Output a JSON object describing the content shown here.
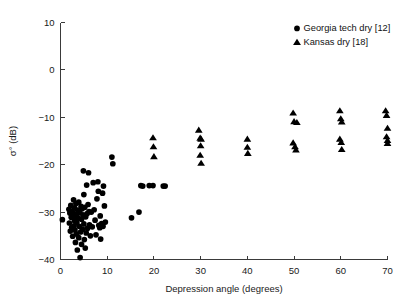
{
  "figure": {
    "background_color": "#ffffff",
    "marker_color": "#000000",
    "axis_color": "#3a3a3a"
  },
  "axes": {
    "x_title": "Depression angle (degrees)",
    "y_title": "σ° (dB)",
    "x_ticks": [
      "0",
      "10",
      "20",
      "30",
      "40",
      "50",
      "60",
      "70"
    ],
    "y_ticks": [
      "10",
      "0",
      "−10",
      "−20",
      "−30",
      "−40"
    ]
  },
  "legend": {
    "entries": [
      {
        "marker": "circle",
        "label": "Georgia tech dry [12]"
      },
      {
        "marker": "triangle",
        "label": "Kansas dry [18]"
      }
    ]
  },
  "chart_data": {
    "type": "scatter",
    "title": "",
    "xlabel": "Depression angle (degrees)",
    "ylabel": "σ° (dB)",
    "xlim": [
      0,
      70
    ],
    "ylim": [
      -40,
      10
    ],
    "xticks": [
      0,
      10,
      20,
      30,
      40,
      50,
      60,
      70
    ],
    "yticks": [
      10,
      0,
      -10,
      -20,
      -30,
      -40
    ],
    "grid": false,
    "legend_position": "top-right",
    "series": [
      {
        "name": "Georgia tech dry [12]",
        "marker": "circle",
        "color": "#000000",
        "points": [
          [
            0.4,
            -31.6
          ],
          [
            1.8,
            -29.4
          ],
          [
            1.9,
            -32.3
          ],
          [
            2.0,
            -30.2
          ],
          [
            2.1,
            -34.0
          ],
          [
            2.2,
            -28.6
          ],
          [
            2.3,
            -31.1
          ],
          [
            2.4,
            -33.2
          ],
          [
            2.5,
            -29.8
          ],
          [
            2.6,
            -35.1
          ],
          [
            2.7,
            -30.7
          ],
          [
            2.8,
            -27.4
          ],
          [
            2.9,
            -32.9
          ],
          [
            3.0,
            -29.1
          ],
          [
            3.0,
            -31.8
          ],
          [
            3.1,
            -33.8
          ],
          [
            3.2,
            -30.4
          ],
          [
            3.2,
            -36.4
          ],
          [
            3.3,
            -28.2
          ],
          [
            3.4,
            -34.6
          ],
          [
            3.5,
            -30.9
          ],
          [
            3.5,
            -32.2
          ],
          [
            3.6,
            -38.0
          ],
          [
            3.7,
            -29.6
          ],
          [
            3.8,
            -31.3
          ],
          [
            3.9,
            -35.4
          ],
          [
            3.9,
            -27.9
          ],
          [
            4.0,
            -33.0
          ],
          [
            4.1,
            -30.1
          ],
          [
            4.2,
            -39.6
          ],
          [
            4.3,
            -34.2
          ],
          [
            4.4,
            -28.8
          ],
          [
            4.5,
            -31.5
          ],
          [
            4.5,
            -36.8
          ],
          [
            4.6,
            -29.3
          ],
          [
            4.7,
            -33.6
          ],
          [
            4.8,
            -30.6
          ],
          [
            4.9,
            -21.3
          ],
          [
            5.0,
            -26.3
          ],
          [
            5.0,
            -32.5
          ],
          [
            5.1,
            -35.8
          ],
          [
            5.2,
            -29.0
          ],
          [
            5.3,
            -37.6
          ],
          [
            5.4,
            -31.0
          ],
          [
            5.5,
            -34.4
          ],
          [
            5.6,
            -24.3
          ],
          [
            5.7,
            -30.3
          ],
          [
            5.8,
            -33.4
          ],
          [
            5.9,
            -28.4
          ],
          [
            6.0,
            -21.7
          ],
          [
            6.1,
            -29.9
          ],
          [
            6.2,
            -32.7
          ],
          [
            6.4,
            -35.0
          ],
          [
            6.6,
            -30.0
          ],
          [
            6.8,
            -33.1
          ],
          [
            7.0,
            -23.8
          ],
          [
            7.2,
            -29.5
          ],
          [
            7.4,
            -31.7
          ],
          [
            7.6,
            -34.8
          ],
          [
            7.8,
            -27.2
          ],
          [
            8.0,
            -23.6
          ],
          [
            8.1,
            -25.6
          ],
          [
            8.2,
            -32.8
          ],
          [
            8.4,
            -33.3
          ],
          [
            8.5,
            -30.8
          ],
          [
            8.6,
            -35.7
          ],
          [
            8.8,
            -32.4
          ],
          [
            9.0,
            -26.0
          ],
          [
            9.1,
            -33.0
          ],
          [
            9.2,
            -24.5
          ],
          [
            9.4,
            -28.7
          ],
          [
            9.6,
            -32.1
          ],
          [
            11.0,
            -18.4
          ],
          [
            11.2,
            -19.8
          ],
          [
            15.2,
            -31.2
          ],
          [
            16.8,
            -30.0
          ],
          [
            17.2,
            -24.4
          ],
          [
            17.6,
            -24.5
          ],
          [
            19.0,
            -24.4
          ],
          [
            19.8,
            -24.4
          ],
          [
            22.0,
            -24.5
          ],
          [
            22.4,
            -24.5
          ]
        ]
      },
      {
        "name": "Kansas dry [18]",
        "marker": "triangle",
        "color": "#000000",
        "points": [
          [
            19.8,
            -14.3
          ],
          [
            19.9,
            -16.2
          ],
          [
            20.0,
            -18.3
          ],
          [
            29.6,
            -12.7
          ],
          [
            29.9,
            -14.4
          ],
          [
            30.1,
            -14.6
          ],
          [
            30.0,
            -16.0
          ],
          [
            29.9,
            -18.0
          ],
          [
            30.1,
            -19.7
          ],
          [
            40.0,
            -14.6
          ],
          [
            40.0,
            -16.3
          ],
          [
            40.1,
            -17.6
          ],
          [
            49.8,
            -9.1
          ],
          [
            50.0,
            -10.9
          ],
          [
            50.6,
            -11.1
          ],
          [
            49.8,
            -15.4
          ],
          [
            50.2,
            -16.2
          ],
          [
            50.4,
            -16.9
          ],
          [
            59.8,
            -8.6
          ],
          [
            60.0,
            -10.3
          ],
          [
            60.2,
            -11.0
          ],
          [
            59.8,
            -14.6
          ],
          [
            60.1,
            -15.3
          ],
          [
            60.2,
            -16.8
          ],
          [
            69.6,
            -8.6
          ],
          [
            69.8,
            -9.6
          ],
          [
            70.0,
            -12.3
          ],
          [
            69.8,
            -14.1
          ],
          [
            70.0,
            -14.9
          ],
          [
            70.0,
            -15.5
          ]
        ]
      }
    ]
  }
}
